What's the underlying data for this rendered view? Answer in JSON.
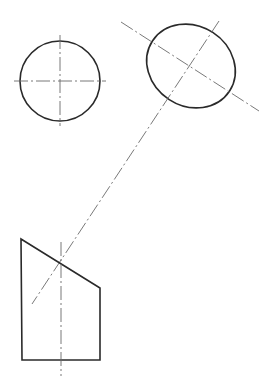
{
  "drawing": {
    "type": "technical-projection-sketch",
    "views": [
      {
        "id": "circle-view",
        "shape": "circle",
        "has_centerlines": true
      },
      {
        "id": "ellipse-view",
        "shape": "ellipse",
        "has_centerlines": true,
        "rotation_deg": 33
      },
      {
        "id": "truncated-prism-view",
        "shape": "pentagon",
        "has_centerlines": true
      }
    ],
    "colors": {
      "outline": "#2a2a2a",
      "centerline": "#6a6a6a",
      "background": "#ffffff"
    }
  }
}
